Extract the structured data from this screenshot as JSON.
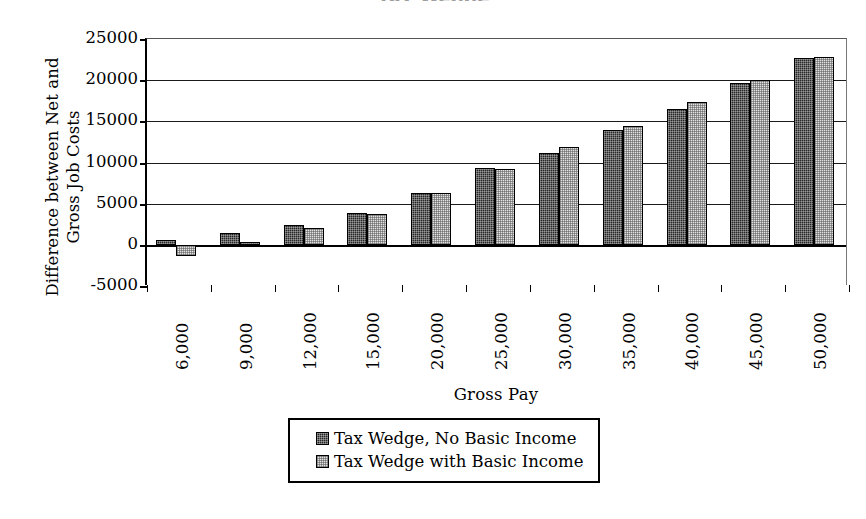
{
  "chart_data": {
    "type": "bar",
    "title": "",
    "xlabel": "Gross Pay",
    "ylabel": "Difference between Net and Gross Job Costs",
    "ylim": [
      -5000,
      25000
    ],
    "ytick_step": 5000,
    "yticks": [
      25000,
      20000,
      15000,
      10000,
      5000,
      0,
      -5000
    ],
    "ytick_labels": [
      "25000",
      "20000",
      "15000",
      "10000",
      "5000",
      "0",
      "-5000"
    ],
    "grid": true,
    "legend_position": "bottom",
    "categories": [
      "6,000",
      "9,000",
      "12,000",
      "15,000",
      "20,000",
      "25,000",
      "30,000",
      "35,000",
      "40,000",
      "45,000",
      "50,000"
    ],
    "series": [
      {
        "name": "Tax Wedge, No Basic Income",
        "swatch": "dark-checker",
        "color": "#272727",
        "values": [
          600,
          1450,
          2450,
          3850,
          6350,
          9300,
          11150,
          13900,
          16500,
          19650,
          22650
        ]
      },
      {
        "name": "Tax Wedge with Basic Income",
        "swatch": "light-checker",
        "color": "#e2e2e2",
        "values": [
          -1400,
          350,
          2050,
          3700,
          6250,
          9250,
          11900,
          14400,
          17400,
          20050,
          22850
        ]
      }
    ]
  },
  "axis": {
    "y_title_line1": "Difference between Net and",
    "y_title_line2": "Gross Job Costs",
    "x_title": "Gross Pay"
  },
  "legend": {
    "items": [
      {
        "label": "Tax Wedge, No Basic Income"
      },
      {
        "label": "Tax Wedge with Basic Income"
      }
    ]
  },
  "cropped_title": "Tax Wedge"
}
